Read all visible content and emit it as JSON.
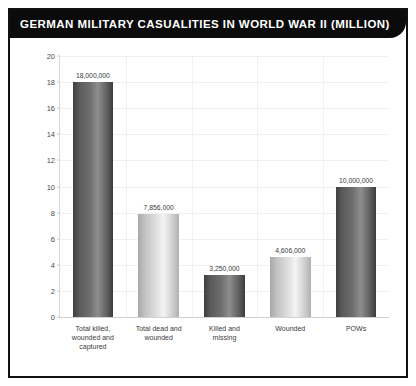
{
  "window": {
    "title": "GERMAN MILITARY CASUALITIES IN WORLD WAR II (MILLION)"
  },
  "chart_data": {
    "type": "bar",
    "title": "GERMAN MILITARY CASUALITIES IN WORLD WAR II (MILLION)",
    "xlabel": "",
    "ylabel": "",
    "ylim": [
      0,
      20
    ],
    "ytick_labels": [
      "0",
      "2",
      "4",
      "6",
      "8",
      "10",
      "12",
      "14",
      "16",
      "18",
      "20"
    ],
    "ytick_values": [
      0,
      2,
      4,
      6,
      8,
      10,
      12,
      14,
      16,
      18,
      20
    ],
    "grid": true,
    "legend": "none",
    "units": "million",
    "categories": [
      "Total killed,\nwounded and\ncaptured",
      "Total dead and\nwounded",
      "Killed and\nmissing",
      "Wounded",
      "POWs"
    ],
    "values": [
      18,
      7.856,
      3.25,
      4.606,
      10
    ],
    "data_labels": [
      "18,000,000",
      "7,856,000",
      "3,250,000",
      "4,606,000",
      "10,000,000"
    ],
    "bar_shades": [
      "dark",
      "light",
      "dark",
      "light",
      "dark"
    ],
    "colors": {
      "title_bar": "#0b0b0b",
      "title_text": "#ffffff",
      "frame": "#111111",
      "plot_background": "#ffffff",
      "bar_dark": "#6e6e6e",
      "bar_light": "#dcdcdc",
      "gridline": "#f0f0f0",
      "axis": "#d0d0d0",
      "tick_text": "#4a4a4a"
    }
  }
}
